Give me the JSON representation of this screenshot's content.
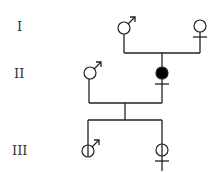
{
  "diagram": {
    "type": "pedigree",
    "generations": [
      {
        "label": "I",
        "y": 28
      },
      {
        "label": "II",
        "y": 74
      },
      {
        "label": "III",
        "y": 150
      }
    ],
    "individuals": [
      {
        "id": "I-1",
        "generation": "I",
        "sex": "male",
        "status": "unaffected",
        "x": 124,
        "y": 28
      },
      {
        "id": "I-2",
        "generation": "I",
        "sex": "female",
        "status": "unaffected",
        "x": 200,
        "y": 26
      },
      {
        "id": "II-1",
        "generation": "II",
        "sex": "male",
        "status": "unaffected",
        "x": 90,
        "y": 73
      },
      {
        "id": "II-2",
        "generation": "II",
        "sex": "female",
        "status": "affected",
        "x": 162,
        "y": 73
      },
      {
        "id": "III-1",
        "generation": "III",
        "sex": "male",
        "status": "carrier",
        "x": 89,
        "y": 151
      },
      {
        "id": "III-2",
        "generation": "III",
        "sex": "female",
        "status": "carrier",
        "x": 162,
        "y": 150
      }
    ],
    "colors": {
      "line": "#222222",
      "affected_fill": "#000000",
      "background": "#ffffff"
    }
  }
}
